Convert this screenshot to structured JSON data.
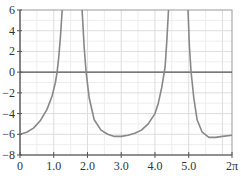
{
  "chart_data": {
    "type": "line",
    "title": "",
    "xlabel": "",
    "ylabel": "",
    "xlim": [
      0,
      6.2832
    ],
    "ylim": [
      -8,
      6
    ],
    "grid": true,
    "legend": null,
    "x_ticks": [
      {
        "value": 0,
        "label": "0"
      },
      {
        "value": 1,
        "label": "1.0"
      },
      {
        "value": 2,
        "label": "2.0"
      },
      {
        "value": 3,
        "label": "3.0"
      },
      {
        "value": 4,
        "label": "4.0"
      },
      {
        "value": 5,
        "label": "5.0"
      },
      {
        "value": 6.2832,
        "label": "2π"
      }
    ],
    "y_ticks": [
      {
        "value": 6,
        "label": "6"
      },
      {
        "value": 4,
        "label": "4"
      },
      {
        "value": 2,
        "label": "2"
      },
      {
        "value": 0,
        "label": "0"
      },
      {
        "value": -2,
        "label": "−2"
      },
      {
        "value": -4,
        "label": "−4"
      },
      {
        "value": -6,
        "label": "−6"
      },
      {
        "value": -8,
        "label": "−8"
      }
    ],
    "asymptotes_approx": [
      1.55,
      4.69
    ],
    "series": [
      {
        "name": "branch-1",
        "x": [
          0,
          0.2,
          0.4,
          0.6,
          0.8,
          0.95,
          1.05,
          1.1,
          1.15,
          1.2,
          1.25
        ],
        "y": [
          -6.0,
          -5.8,
          -5.4,
          -4.7,
          -3.6,
          -2.3,
          -1.0,
          0.0,
          1.5,
          3.5,
          6.0
        ]
      },
      {
        "name": "branch-2",
        "x": [
          1.84,
          1.9,
          1.96,
          2.05,
          2.2,
          2.4,
          2.6,
          2.8,
          3.0,
          3.2,
          3.4,
          3.6,
          3.8,
          4.0,
          4.1,
          4.2,
          4.3,
          4.35,
          4.4
        ],
        "y": [
          6.0,
          2.5,
          0.0,
          -2.5,
          -4.6,
          -5.6,
          -6.0,
          -6.2,
          -6.2,
          -6.1,
          -5.9,
          -5.6,
          -5.0,
          -4.0,
          -3.0,
          -1.5,
          0.5,
          3.0,
          6.0
        ]
      },
      {
        "name": "branch-3",
        "x": [
          4.98,
          5.02,
          5.07,
          5.15,
          5.25,
          5.4,
          5.6,
          5.8,
          6.0,
          6.2832
        ],
        "y": [
          6.0,
          2.5,
          0.0,
          -2.5,
          -4.6,
          -5.8,
          -6.3,
          -6.3,
          -6.2,
          -6.1
        ]
      }
    ]
  },
  "colors": {
    "curve": "#888888",
    "axis": "#555555",
    "grid_major": "#dddddd",
    "grid_minor": "#eeeeee",
    "frame": "#999999",
    "text": "#333333"
  }
}
